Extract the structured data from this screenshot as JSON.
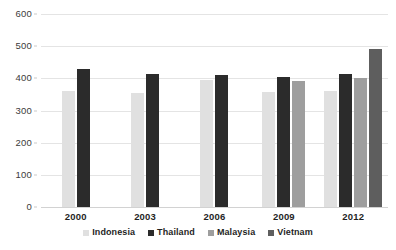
{
  "chart_data": {
    "type": "bar",
    "title": "",
    "subtitle": "",
    "xlabel": "",
    "ylabel": "",
    "categories": [
      "2000",
      "2003",
      "2006",
      "2009",
      "2012"
    ],
    "series": [
      {
        "name": "Indonesia",
        "color": "#e0e0e0",
        "values": [
          360,
          355,
          395,
          358,
          360
        ]
      },
      {
        "name": "Thailand",
        "color": "#2b2b2b",
        "values": [
          428,
          412,
          410,
          405,
          412
        ]
      },
      {
        "name": "Malaysia",
        "color": "#9e9e9e",
        "values": [
          null,
          null,
          null,
          392,
          400
        ]
      },
      {
        "name": "Vietnam",
        "color": "#5e5e5e",
        "values": [
          null,
          null,
          null,
          null,
          490
        ]
      }
    ],
    "ylim": [
      0,
      600
    ],
    "ytick_step": 100,
    "yticks": [
      "0",
      "100",
      "200",
      "300",
      "400",
      "500",
      "600"
    ],
    "grid": true,
    "legend_position": "bottom"
  }
}
